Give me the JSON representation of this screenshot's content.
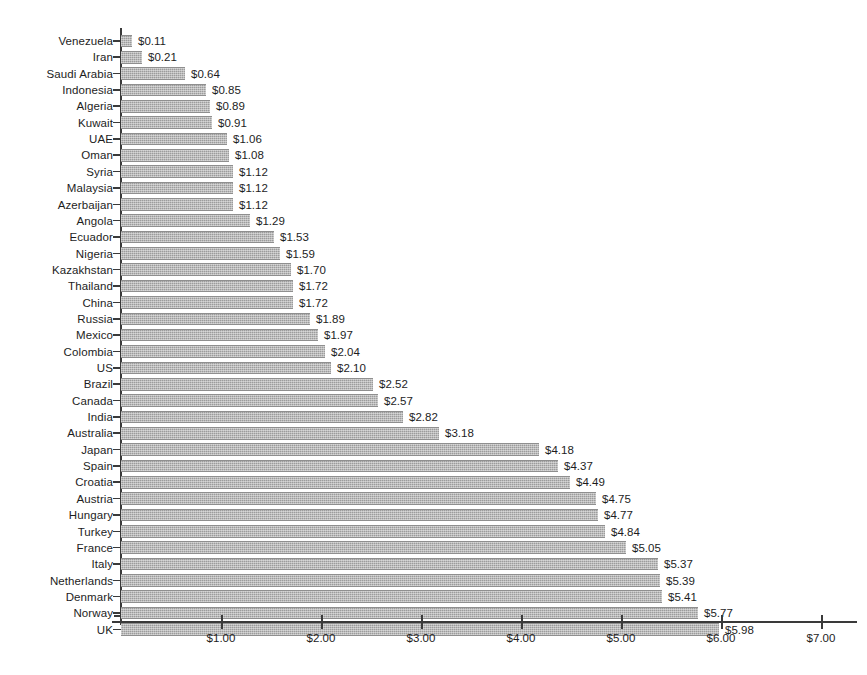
{
  "chart_data": {
    "type": "bar",
    "orientation": "horizontal",
    "title": "",
    "subtitle": "",
    "xlabel": "",
    "ylabel": "",
    "xlim": [
      0,
      7
    ],
    "grid": false,
    "legend": false,
    "value_prefix": "$",
    "bar_color": "#9c9c9c",
    "axis_color": "#3a3a3a",
    "text_color": "#1d1d1d",
    "xticks": [
      {
        "value": 1,
        "label": "$1.00"
      },
      {
        "value": 2,
        "label": "$2.00"
      },
      {
        "value": 3,
        "label": "$3.00"
      },
      {
        "value": 4,
        "label": "$4.00"
      },
      {
        "value": 5,
        "label": "$5.00"
      },
      {
        "value": 6,
        "label": "$6.00"
      },
      {
        "value": 7,
        "label": "$7.00"
      }
    ],
    "categories": [
      "Venezuela",
      "Iran",
      "Saudi Arabia",
      "Indonesia",
      "Algeria",
      "Kuwait",
      "UAE",
      "Oman",
      "Syria",
      "Malaysia",
      "Azerbaijan",
      "Angola",
      "Ecuador",
      "Nigeria",
      "Kazakhstan",
      "Thailand",
      "China",
      "Russia",
      "Mexico",
      "Colombia",
      "US",
      "Brazil",
      "Canada",
      "India",
      "Australia",
      "Japan",
      "Spain",
      "Croatia",
      "Austria",
      "Hungary",
      "Turkey",
      "France",
      "Italy",
      "Netherlands",
      "Denmark",
      "Norway",
      "UK"
    ],
    "values": [
      0.11,
      0.21,
      0.64,
      0.85,
      0.89,
      0.91,
      1.06,
      1.08,
      1.12,
      1.12,
      1.12,
      1.29,
      1.53,
      1.59,
      1.7,
      1.72,
      1.72,
      1.89,
      1.97,
      2.04,
      2.1,
      2.52,
      2.57,
      2.82,
      3.18,
      4.18,
      4.37,
      4.49,
      4.75,
      4.77,
      4.84,
      5.05,
      5.37,
      5.39,
      5.41,
      5.77,
      5.98
    ],
    "data_labels": [
      "$0.11",
      "$0.21",
      "$0.64",
      "$0.85",
      "$0.89",
      "$0.91",
      "$1.06",
      "$1.08",
      "$1.12",
      "$1.12",
      "$1.12",
      "$1.29",
      "$1.53",
      "$1.59",
      "$1.70",
      "$1.72",
      "$1.72",
      "$1.89",
      "$1.97",
      "$2.04",
      "$2.10",
      "$2.52",
      "$2.57",
      "$2.82",
      "$3.18",
      "$4.18",
      "$4.37",
      "$4.49",
      "$4.75",
      "$4.77",
      "$4.84",
      "$5.05",
      "$5.37",
      "$5.39",
      "$5.41",
      "$5.77",
      "$5.98"
    ]
  }
}
